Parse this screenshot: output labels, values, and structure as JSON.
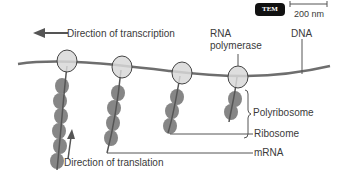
{
  "diagram": {
    "badge": "TEM",
    "scale_bar": "200 nm",
    "labels": {
      "direction_transcription": "Direction of transcription",
      "rna_polymerase_1": "RNA",
      "rna_polymerase_2": "polymerase",
      "dna": "DNA",
      "polyribosome": "Polyribosome",
      "ribosome": "Ribosome",
      "mrna": "mRNA",
      "direction_translation": "Direction of translation"
    },
    "colors": {
      "dna": "#6e6e6e",
      "ribosome": "#7a7a7a",
      "polymerase_fill": "#d8d8d8",
      "polymerase_stroke": "#444444",
      "text": "#3a3a3a"
    }
  }
}
